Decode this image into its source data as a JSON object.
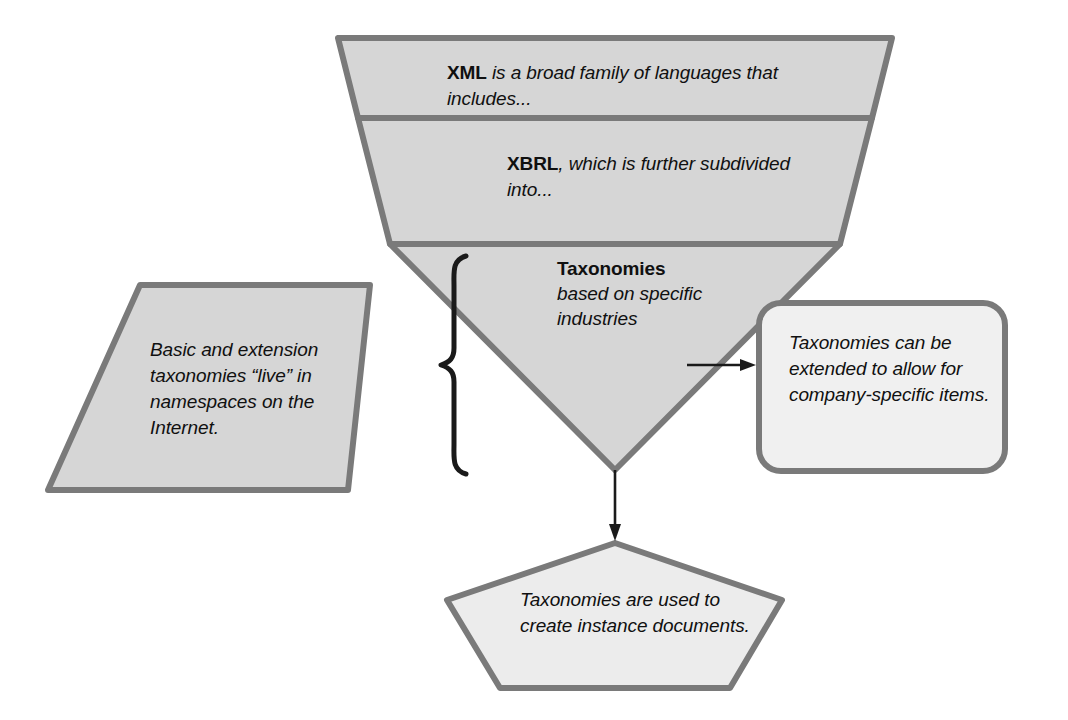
{
  "diagram": {
    "colors": {
      "shape_fill": "#d6d6d6",
      "shape_fill_light": "#efefef",
      "shape_stroke": "#7a7a7a",
      "text": "#101010",
      "arrow": "#1a1a1a",
      "background": "#ffffff"
    },
    "funnel": {
      "name": "inverted-triangle-funnel",
      "bands": [
        {
          "id": "xml",
          "keyword": "XML",
          "keyword_style": "bold",
          "text": " is a broad family of languages that includes..."
        },
        {
          "id": "xbrl",
          "keyword": "XBRL",
          "keyword_style": "bold",
          "text": ", which is further subdivided into..."
        },
        {
          "id": "taxonomies",
          "keyword": "Taxonomies",
          "keyword_style": "bold",
          "text": "based on specific industries"
        }
      ]
    },
    "annotations": [
      {
        "id": "left-note",
        "shape": "parallelogram",
        "text": "Basic and extension taxonomies “live” in namespaces on the Internet."
      },
      {
        "id": "right-note",
        "shape": "rounded-rectangle",
        "text": "Taxonomies can be extended to allow for company-specific items."
      },
      {
        "id": "bottom-note",
        "shape": "pentagon",
        "text": "Taxonomies are used to create instance documents."
      }
    ],
    "connectors": [
      {
        "id": "brace",
        "kind": "curly-brace",
        "points_to": "left-note"
      },
      {
        "id": "arrow-right",
        "kind": "arrow",
        "direction": "right",
        "from": "taxonomies",
        "to": "right-note"
      },
      {
        "id": "arrow-down",
        "kind": "arrow",
        "direction": "down",
        "from": "taxonomies",
        "to": "bottom-note"
      }
    ]
  }
}
